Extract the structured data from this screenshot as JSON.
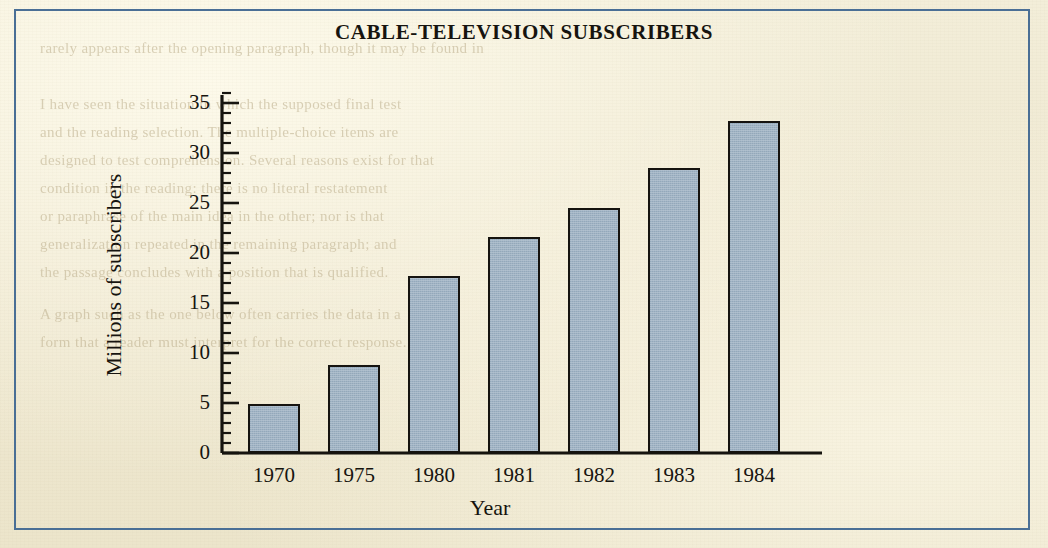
{
  "page": {
    "background_color": "#efe8d1",
    "frame_color": "#4a6f96",
    "ink_color": "#16140f"
  },
  "ghost_text": [
    {
      "text": "rarely appears after the opening paragraph, though it may be found in",
      "x": 40,
      "y": 40
    },
    {
      "text": "I have seen the situation in which the supposed final test",
      "x": 40,
      "y": 96
    },
    {
      "text": "and the reading selection.  The multiple-choice items are",
      "x": 40,
      "y": 124
    },
    {
      "text": "designed to test comprehension.  Several reasons exist for that",
      "x": 40,
      "y": 152
    },
    {
      "text": "condition in the reading:  there is no literal restatement",
      "x": 40,
      "y": 180
    },
    {
      "text": "or paraphrase of the main idea in the other; nor is that",
      "x": 40,
      "y": 208
    },
    {
      "text": "generalization repeated in the remaining paragraph;  and",
      "x": 40,
      "y": 236
    },
    {
      "text": "the passage concludes with a position that is qualified.",
      "x": 40,
      "y": 264
    },
    {
      "text": "A graph such as the one below often carries the data in a",
      "x": 40,
      "y": 306
    },
    {
      "text": "form that a reader must interpret for the correct response.",
      "x": 40,
      "y": 334
    }
  ],
  "chart_data": {
    "type": "bar",
    "title": "CABLE-TELEVISION SUBSCRIBERS",
    "xlabel": "Year",
    "ylabel": "Millions of subscribers",
    "categories": [
      "1970",
      "1975",
      "1980",
      "1981",
      "1982",
      "1983",
      "1984"
    ],
    "values": [
      4.9,
      8.8,
      17.7,
      21.6,
      24.5,
      28.5,
      33.2
    ],
    "ylim": [
      0,
      35
    ],
    "ytick_labels": [
      "0",
      "5",
      "10",
      "15",
      "20",
      "25",
      "30",
      "35"
    ],
    "ytick_values": [
      0,
      5,
      10,
      15,
      20,
      25,
      30,
      35
    ],
    "minor_tick_step": 1,
    "grid": false,
    "legend": null,
    "bar_fill_color": "#9fb3c4",
    "bar_edge_color": "#15130f"
  }
}
